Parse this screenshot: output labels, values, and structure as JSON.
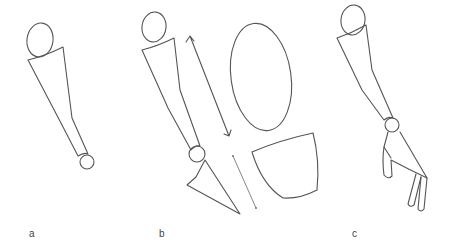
{
  "figure": {
    "panels": [
      {
        "label": "a",
        "description": "Arm sketch: shoulder oval, tapered upper-limb segment, wrist joint circle"
      },
      {
        "label": "b",
        "description": "Arm sketch with triangular hand segment, double-headed arrow, oval and D-shaped outline, and short line"
      },
      {
        "label": "c",
        "description": "Arm sketch with wrist joint and hand with extended finger segments"
      }
    ]
  },
  "colors": {
    "stroke": "#555555",
    "background": "#ffffff",
    "label": "#444444"
  }
}
